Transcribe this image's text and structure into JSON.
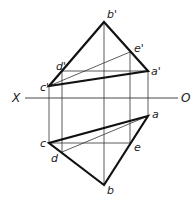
{
  "diagram": {
    "type": "orthographic-projection",
    "axis": {
      "left_label": "X",
      "right_label": "O",
      "y": 98,
      "x1": 25,
      "x2": 178
    },
    "front_view": {
      "points": {
        "a'": [
          148,
          71
        ],
        "b'": [
          104,
          22
        ],
        "c'": [
          49,
          86
        ],
        "d'": [
          62,
          71
        ],
        "e'": [
          130,
          52
        ]
      },
      "labels": {
        "a": "a'",
        "b": "b'",
        "c": "c'",
        "d": "d'",
        "e": "e'"
      }
    },
    "top_view": {
      "points": {
        "a": [
          148,
          116
        ],
        "b": [
          104,
          185
        ],
        "c": [
          49,
          143
        ],
        "d": [
          62,
          152
        ],
        "e": [
          130,
          143
        ]
      },
      "labels": {
        "a": "a",
        "b": "b",
        "c": "c",
        "d": "d",
        "e": "e"
      }
    },
    "thick_edges": [
      "b'c'",
      "b'a'",
      "c'a'",
      "ca",
      "cb",
      "ab"
    ],
    "thin_lines": [
      "c'e'",
      "d'a'",
      "de",
      "da",
      "ce",
      "projectors"
    ]
  }
}
